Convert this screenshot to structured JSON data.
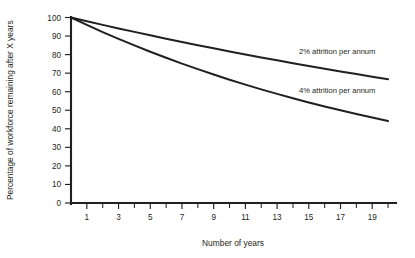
{
  "chart_data": {
    "type": "line",
    "title": "",
    "xlabel": "Number of years",
    "ylabel": "Percentage of workforce remaining after X years",
    "xlim": [
      0,
      20.5
    ],
    "ylim": [
      0,
      100
    ],
    "grid": false,
    "legend_position": "inline-annotation",
    "x_ticks_major": [
      1,
      3,
      5,
      7,
      9,
      11,
      13,
      15,
      17,
      19
    ],
    "x_ticks_minor": [
      2,
      4,
      6,
      8,
      10,
      12,
      14,
      16,
      18,
      20
    ],
    "x_tick_labels": [
      "1",
      "3",
      "5",
      "7",
      "9",
      "11",
      "13",
      "15",
      "17",
      "19"
    ],
    "y_ticks": [
      0,
      10,
      20,
      30,
      40,
      50,
      60,
      70,
      80,
      90,
      100
    ],
    "y_tick_labels": [
      "0",
      "10",
      "20",
      "30",
      "40",
      "50",
      "60",
      "70",
      "80",
      "90",
      "100"
    ],
    "x": [
      0,
      1,
      2,
      3,
      4,
      5,
      6,
      7,
      8,
      9,
      10,
      11,
      12,
      13,
      14,
      15,
      16,
      17,
      18,
      19,
      20
    ],
    "series": [
      {
        "name": "2% attrition per annum",
        "annotation": "2% attrition per annum",
        "values": [
          100,
          98,
          96.04,
          94.12,
          92.24,
          90.39,
          88.58,
          86.81,
          85.07,
          83.37,
          81.71,
          80.07,
          78.47,
          76.9,
          75.36,
          73.86,
          72.38,
          70.93,
          69.51,
          68.12,
          66.76
        ]
      },
      {
        "name": "4% attrition per annum",
        "annotation": "4% attrition per annum",
        "values": [
          100,
          96,
          92.16,
          88.47,
          84.93,
          81.54,
          78.28,
          75.14,
          72.14,
          69.25,
          66.48,
          63.82,
          61.27,
          58.82,
          56.47,
          54.21,
          52.04,
          49.96,
          47.96,
          46.04,
          44.2
        ]
      }
    ],
    "colors": {
      "axis": "#231f20",
      "curve": "#231f20",
      "text": "#231f20",
      "background": "#ffffff"
    }
  }
}
